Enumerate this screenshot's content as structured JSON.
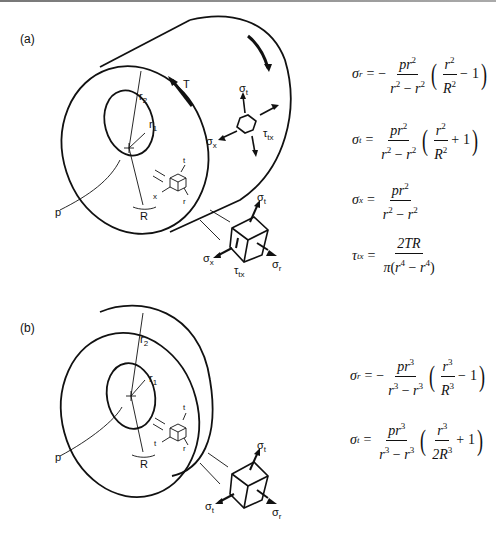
{
  "figure": {
    "panels": [
      {
        "id": "a",
        "label": "(a)",
        "description": "Thick-walled hollow cylinder under internal pressure p and torque T",
        "dimension_labels": {
          "outer_radius": "r2",
          "inner_radius": "r1",
          "radius": "R",
          "pressure": "p",
          "torque": "T"
        },
        "element_axes": [
          "t",
          "x",
          "r"
        ],
        "surface_element_labels": [
          "σt",
          "σx",
          "τtx"
        ],
        "exploded_element_labels": [
          "σt",
          "σx",
          "τtx",
          "σr"
        ],
        "equations": [
          {
            "lhs": "σr",
            "text": "σr = −(p r1²)/(r2² − r1²) · (r2²/R² − 1)"
          },
          {
            "lhs": "σt",
            "text": "σt = (p r1²)/(r2² − r1²) · (r2²/R² + 1)"
          },
          {
            "lhs": "σx",
            "text": "σx = (p r1²)/(r2² − r1²)"
          },
          {
            "lhs": "τtx",
            "text": "τtx = 2TR / (π(r2⁴ − r1⁴))"
          }
        ]
      },
      {
        "id": "b",
        "label": "(b)",
        "description": "Thick-walled hollow sphere under internal pressure p",
        "dimension_labels": {
          "outer_radius": "r2",
          "inner_radius": "r1",
          "radius": "R",
          "pressure": "p"
        },
        "element_axes": [
          "t",
          "t",
          "r"
        ],
        "exploded_element_labels": [
          "σt",
          "σt",
          "σr"
        ],
        "equations": [
          {
            "lhs": "σr",
            "text": "σr = −(p r1³)/(r2³ − r1³) · (r2³/R³ − 1)"
          },
          {
            "lhs": "σt",
            "text": "σt = (p r1³)/(r2³ − r1³) · (r2³/(2R³) + 1)"
          }
        ]
      }
    ]
  },
  "labels": {
    "a": "(a)",
    "b": "(b)",
    "sigma": "σ",
    "tau": "τ",
    "pi": "π",
    "r": "r",
    "t": "t",
    "x": "x",
    "tx": "tx",
    "one": "1",
    "two": "2",
    "R": "R",
    "p": "p",
    "T": "T",
    "eq": "=",
    "minus": "−",
    "plus": "+",
    "lparen": "(",
    "rparen": ")",
    "num2": "2",
    "num3": "3",
    "num4": "4",
    "twoTR": "2TR",
    "twoR": "2R"
  }
}
